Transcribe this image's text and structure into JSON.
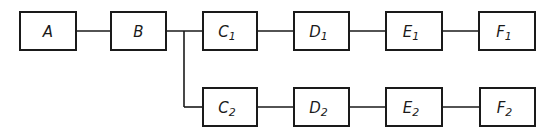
{
  "diagram": {
    "type": "block-diagram",
    "colors": {
      "stroke": "#1a1a1a",
      "background": "#ffffff"
    },
    "blocks": [
      {
        "id": "A",
        "letter": "A",
        "sub": "",
        "x": 20,
        "y": 12,
        "w": 56,
        "h": 38
      },
      {
        "id": "B",
        "letter": "B",
        "sub": "",
        "x": 111,
        "y": 12,
        "w": 55,
        "h": 38
      },
      {
        "id": "C1",
        "letter": "C",
        "sub": "1",
        "x": 203,
        "y": 12,
        "w": 54,
        "h": 38
      },
      {
        "id": "D1",
        "letter": "D",
        "sub": "1",
        "x": 294,
        "y": 12,
        "w": 55,
        "h": 38
      },
      {
        "id": "E1",
        "letter": "E",
        "sub": "1",
        "x": 386,
        "y": 12,
        "w": 56,
        "h": 38
      },
      {
        "id": "F1",
        "letter": "F",
        "sub": "1",
        "x": 479,
        "y": 12,
        "w": 56,
        "h": 38
      },
      {
        "id": "C2",
        "letter": "C",
        "sub": "2",
        "x": 203,
        "y": 88,
        "w": 54,
        "h": 38
      },
      {
        "id": "D2",
        "letter": "D",
        "sub": "2",
        "x": 294,
        "y": 88,
        "w": 55,
        "h": 38
      },
      {
        "id": "E2",
        "letter": "E",
        "sub": "2",
        "x": 386,
        "y": 88,
        "w": 56,
        "h": 38
      },
      {
        "id": "F2",
        "letter": "F",
        "sub": "2",
        "x": 480,
        "y": 88,
        "w": 55,
        "h": 38
      }
    ],
    "connections": [
      [
        "A",
        "B"
      ],
      [
        "B",
        "C1"
      ],
      [
        "C1",
        "D1"
      ],
      [
        "D1",
        "E1"
      ],
      [
        "E1",
        "F1"
      ],
      [
        "B",
        "C2"
      ],
      [
        "C2",
        "D2"
      ],
      [
        "D2",
        "E2"
      ],
      [
        "E2",
        "F2"
      ]
    ],
    "branch_x": 184
  }
}
